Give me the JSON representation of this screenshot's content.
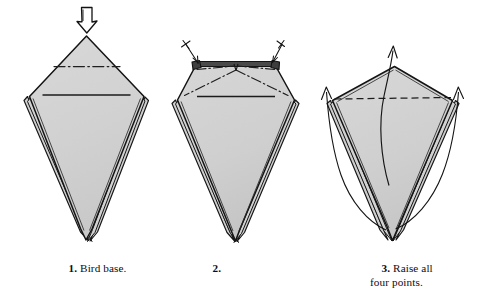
{
  "document": {
    "kind": "origami-instruction-diagram",
    "background_color": "#ffffff",
    "paper_fill_color": "#d2d2d2",
    "paper_fill_shade_color": "#c6c6c6",
    "outline_color": "#1a1a1a",
    "fold_line_color": "#2b2b2b",
    "arrow_color": "#111111",
    "text_color": "#0d0d0d"
  },
  "steps": [
    {
      "id": "step-1",
      "number": "1.",
      "label": "Bird base.",
      "caption_lines": [
        "Bird base."
      ],
      "annotations": {
        "arrows": [
          "hollow-push-arrow-down"
        ],
        "fold_lines": [
          "mountain-dash-dot-horizontal",
          "solid-crease-horizontal"
        ]
      }
    },
    {
      "id": "step-2",
      "number": "2.",
      "label": "",
      "caption_lines": [
        ""
      ],
      "annotations": {
        "arrows": [
          "small-pleat-arrow-left",
          "small-pleat-arrow-right"
        ],
        "fold_lines": [
          "mountain-dash-dot-chevron",
          "solid-crease-horizontal"
        ]
      }
    },
    {
      "id": "step-3",
      "number": "3.",
      "label": "Raise all four points.",
      "caption_lines": [
        "Raise all",
        "four points."
      ],
      "annotations": {
        "arrows": [
          "curved-arrow-up-left",
          "curved-arrow-up-center",
          "curved-arrow-up-right"
        ],
        "fold_lines": [
          "valley-dashed-horizontal"
        ]
      }
    }
  ]
}
